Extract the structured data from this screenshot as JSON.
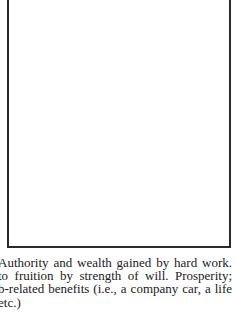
{
  "figure": {
    "frame": {
      "border_color": "#2a2a2a",
      "content": ""
    }
  },
  "body_text": {
    "lines": [
      "Authority and wealth gained by hard work.",
      "to fruition by strength of will. Prosperity;",
      "b-related benefits (i.e., a company car, a life",
      "etc.)"
    ]
  }
}
